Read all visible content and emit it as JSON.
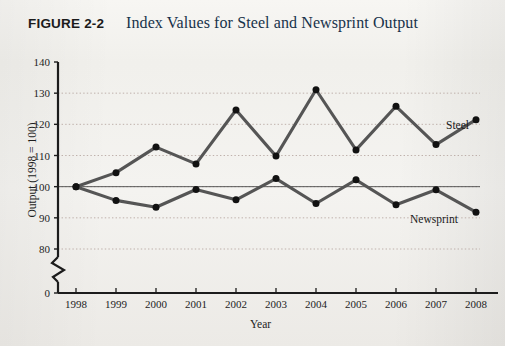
{
  "figure": {
    "number": "FIGURE 2-2",
    "title": "Index Values for Steel and Newsprint Output"
  },
  "chart_data": {
    "type": "line",
    "title": "Index Values for Steel and Newsprint Output",
    "xlabel": "Year",
    "ylabel": "Output (1998 = 100)",
    "categories": [
      1998,
      1999,
      2000,
      2001,
      2002,
      2003,
      2004,
      2005,
      2006,
      2007,
      2008
    ],
    "xtick_labels": [
      "1998",
      "1999",
      "2000",
      "2001",
      "2002",
      "2003",
      "2004",
      "2005",
      "2006",
      "2007",
      "2008"
    ],
    "ytick_labels": [
      "0",
      "80",
      "90",
      "100",
      "110",
      "120",
      "130",
      "140"
    ],
    "ytick_values": [
      0,
      80,
      90,
      100,
      110,
      120,
      130,
      140
    ],
    "ylim": [
      80,
      140
    ],
    "axis_break": true,
    "axis_break_note": "zigzag break on y-axis between 0 and 80",
    "grid": true,
    "grid_style": "dotted horizontal",
    "reference_line": 100,
    "legend_position": "inline-labels",
    "series": [
      {
        "name": "Steel",
        "color": "#555555",
        "values": [
          100,
          104.5,
          112.7,
          107.3,
          124.6,
          109.8,
          131.1,
          111.8,
          125.8,
          113.5,
          121.5
        ]
      },
      {
        "name": "Newsprint",
        "color": "#555555",
        "values": [
          100,
          95.6,
          93.4,
          99.1,
          95.8,
          102.6,
          94.6,
          102.2,
          94.2,
          99.0,
          91.8
        ]
      }
    ]
  },
  "series_labels": {
    "steel": "Steel",
    "newsprint": "Newsprint"
  },
  "axes": {
    "y_title": "Output (1998 = 100)",
    "x_title": "Year"
  }
}
